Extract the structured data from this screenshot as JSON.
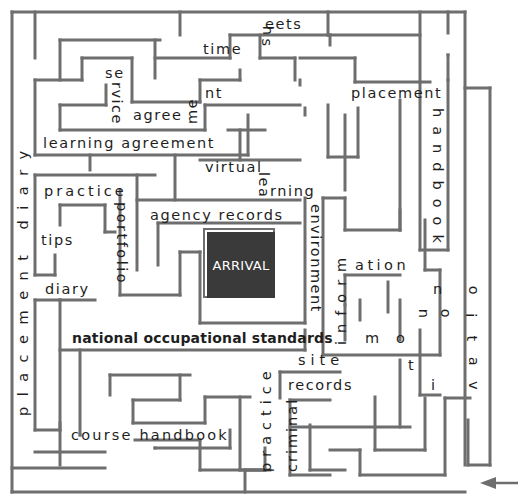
{
  "diagram": {
    "type": "maze",
    "colors": {
      "wall": "#6e6e6e",
      "text": "#1e1e1e",
      "goal_fill": "#3a3a3a",
      "goal_text": "#ffffff",
      "background": "#ffffff"
    },
    "goal": {
      "label": "ARRIVAL"
    },
    "entrance": {
      "icon": "arrow-left-icon",
      "position": "bottom-right"
    },
    "labels": {
      "sheets_s": "s",
      "sheets_h": "h",
      "sheets_rest": "eets",
      "time": "time",
      "se": "se",
      "rvice": "rvice",
      "agree": "agree",
      "me": "me",
      "nt": "nt",
      "learning_agreement": "learning agreement",
      "placement_top": "placement",
      "handbook_vertical": "handbook",
      "virtual": "virtual",
      "lea": "lea",
      "rning": "rning",
      "environment": "environment",
      "practice_left": "practice",
      "portfolio": "portfolio",
      "tips": "tips",
      "diary_left": "diary",
      "agency_records": "agency records",
      "placement_diary_vertical": "placement diary",
      "national_occupational_standards": "national occupational standards",
      "inform": "inform",
      "ation": "ation",
      "site": "site",
      "records_bottom": "records",
      "criminal": "criminal",
      "practice_vertical": "practice",
      "course_handbook": "course handbook",
      "motivation": {
        "m": "m",
        "o1": "o",
        "t": "t",
        "i1": "i",
        "v": "v",
        "a": "a",
        "t2": "t",
        "i2": "i",
        "o2": "o",
        "n1": "n",
        "o3": "o",
        "n2": "n"
      }
    },
    "walls": [
      [
        12,
        12,
        465,
        12
      ],
      [
        12,
        12,
        12,
        492
      ],
      [
        12,
        492,
        465,
        492
      ],
      [
        465,
        12,
        465,
        465
      ],
      [
        35,
        12,
        35,
        58
      ],
      [
        180,
        12,
        180,
        35
      ],
      [
        328,
        12,
        328,
        35
      ],
      [
        328,
        35,
        420,
        35
      ],
      [
        420,
        12,
        420,
        82
      ],
      [
        448,
        12,
        448,
        33
      ],
      [
        448,
        55,
        448,
        80
      ],
      [
        448,
        55,
        448,
        55
      ],
      [
        60,
        40,
        160,
        40
      ],
      [
        60,
        40,
        60,
        80
      ],
      [
        155,
        40,
        155,
        78
      ],
      [
        155,
        58,
        230,
        58
      ],
      [
        230,
        58,
        230,
        35
      ],
      [
        230,
        35,
        330,
        35
      ],
      [
        330,
        35,
        330,
        45
      ],
      [
        82,
        58,
        132,
        58
      ],
      [
        82,
        58,
        82,
        80
      ],
      [
        132,
        58,
        132,
        102
      ],
      [
        132,
        102,
        200,
        102
      ],
      [
        200,
        102,
        200,
        80
      ],
      [
        200,
        80,
        240,
        80
      ],
      [
        240,
        80,
        240,
        70
      ],
      [
        35,
        80,
        82,
        80
      ],
      [
        35,
        80,
        35,
        155
      ],
      [
        35,
        155,
        248,
        155
      ],
      [
        60,
        105,
        60,
        130
      ],
      [
        60,
        105,
        106,
        105
      ],
      [
        106,
        85,
        106,
        105
      ],
      [
        60,
        130,
        205,
        130
      ],
      [
        205,
        130,
        205,
        105
      ],
      [
        205,
        105,
        300,
        105
      ],
      [
        248,
        155,
        248,
        115
      ],
      [
        300,
        80,
        300,
        85
      ],
      [
        260,
        35,
        260,
        58
      ],
      [
        260,
        58,
        295,
        58
      ],
      [
        295,
        58,
        295,
        80
      ],
      [
        300,
        58,
        355,
        58
      ],
      [
        355,
        58,
        355,
        82
      ],
      [
        355,
        82,
        430,
        82
      ],
      [
        328,
        105,
        328,
        157
      ],
      [
        328,
        157,
        358,
        157
      ],
      [
        358,
        108,
        358,
        157
      ],
      [
        305,
        108,
        305,
        115
      ],
      [
        228,
        130,
        265,
        130
      ],
      [
        90,
        155,
        90,
        170
      ],
      [
        35,
        175,
        155,
        175
      ],
      [
        35,
        175,
        35,
        275
      ],
      [
        35,
        275,
        55,
        275
      ],
      [
        55,
        275,
        55,
        255
      ],
      [
        60,
        205,
        60,
        225
      ],
      [
        60,
        205,
        105,
        205
      ],
      [
        105,
        205,
        105,
        232
      ],
      [
        105,
        232,
        115,
        232
      ],
      [
        137,
        175,
        137,
        270
      ],
      [
        137,
        200,
        300,
        200
      ],
      [
        175,
        155,
        175,
        200
      ],
      [
        200,
        160,
        300,
        160
      ],
      [
        240,
        130,
        240,
        160
      ],
      [
        120,
        190,
        120,
        295
      ],
      [
        120,
        295,
        180,
        295
      ],
      [
        180,
        295,
        180,
        252
      ],
      [
        180,
        252,
        200,
        252
      ],
      [
        200,
        252,
        200,
        323
      ],
      [
        200,
        323,
        305,
        323
      ],
      [
        305,
        198,
        305,
        323
      ],
      [
        158,
        223,
        158,
        265
      ],
      [
        158,
        223,
        300,
        223
      ],
      [
        35,
        300,
        95,
        300
      ],
      [
        35,
        300,
        35,
        430
      ],
      [
        35,
        430,
        60,
        430
      ],
      [
        60,
        430,
        60,
        300
      ],
      [
        60,
        300,
        60,
        300
      ],
      [
        323,
        198,
        323,
        355
      ],
      [
        323,
        198,
        345,
        198
      ],
      [
        345,
        198,
        345,
        230
      ],
      [
        345,
        230,
        400,
        230
      ],
      [
        400,
        230,
        400,
        210
      ],
      [
        400,
        100,
        400,
        230
      ],
      [
        420,
        82,
        420,
        250
      ],
      [
        420,
        250,
        448,
        250
      ],
      [
        448,
        250,
        448,
        80
      ],
      [
        345,
        115,
        345,
        190
      ],
      [
        345,
        275,
        400,
        275
      ],
      [
        345,
        275,
        345,
        305
      ],
      [
        323,
        355,
        440,
        355
      ],
      [
        440,
        355,
        440,
        270
      ],
      [
        440,
        270,
        425,
        270
      ],
      [
        425,
        270,
        425,
        220
      ],
      [
        388,
        282,
        388,
        312
      ],
      [
        400,
        300,
        400,
        340
      ],
      [
        360,
        300,
        360,
        320
      ],
      [
        345,
        305,
        345,
        340
      ],
      [
        80,
        350,
        80,
        435
      ],
      [
        80,
        435,
        80,
        435
      ],
      [
        60,
        350,
        305,
        350
      ],
      [
        305,
        350,
        305,
        330
      ],
      [
        110,
        375,
        190,
        375
      ],
      [
        110,
        375,
        110,
        395
      ],
      [
        180,
        375,
        180,
        400
      ],
      [
        180,
        400,
        133,
        400
      ],
      [
        133,
        400,
        133,
        423
      ],
      [
        133,
        423,
        205,
        423
      ],
      [
        205,
        423,
        205,
        397
      ],
      [
        205,
        397,
        250,
        397
      ],
      [
        60,
        423,
        60,
        465
      ],
      [
        35,
        452,
        105,
        452
      ],
      [
        135,
        440,
        200,
        440
      ],
      [
        200,
        440,
        200,
        470
      ],
      [
        200,
        470,
        265,
        470
      ],
      [
        265,
        470,
        265,
        448
      ],
      [
        155,
        448,
        155,
        448
      ],
      [
        155,
        448,
        230,
        448
      ],
      [
        230,
        430,
        230,
        448
      ],
      [
        240,
        397,
        240,
        470
      ],
      [
        240,
        470,
        270,
        470
      ],
      [
        12,
        468,
        105,
        468
      ],
      [
        245,
        470,
        245,
        492
      ],
      [
        245,
        470,
        265,
        470
      ],
      [
        280,
        372,
        280,
        398
      ],
      [
        280,
        372,
        340,
        372
      ],
      [
        290,
        400,
        330,
        400
      ],
      [
        290,
        400,
        290,
        475
      ],
      [
        290,
        475,
        330,
        475
      ],
      [
        290,
        427,
        410,
        427
      ],
      [
        400,
        427,
        400,
        360
      ],
      [
        310,
        425,
        310,
        470
      ],
      [
        310,
        470,
        345,
        470
      ],
      [
        330,
        450,
        360,
        450
      ],
      [
        360,
        450,
        360,
        475
      ],
      [
        360,
        475,
        445,
        475
      ],
      [
        445,
        475,
        445,
        398
      ],
      [
        375,
        397,
        375,
        450
      ],
      [
        375,
        450,
        425,
        450
      ],
      [
        425,
        450,
        425,
        398
      ],
      [
        445,
        398,
        470,
        398
      ],
      [
        420,
        330,
        420,
        395
      ],
      [
        420,
        395,
        440,
        395
      ],
      [
        468,
        420,
        468,
        465
      ],
      [
        468,
        465,
        490,
        465
      ],
      [
        490,
        465,
        490,
        88
      ],
      [
        490,
        88,
        465,
        88
      ]
    ]
  }
}
